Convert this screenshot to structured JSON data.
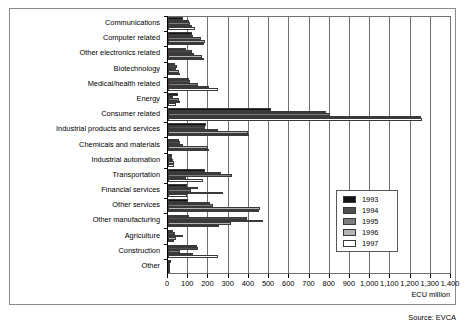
{
  "source_note": "Source: EVCA",
  "axis_unit": "ECU million",
  "legend": {
    "position": "inside-right",
    "entries": [
      {
        "label": "1993",
        "color": "#131313"
      },
      {
        "label": "1994",
        "color": "#4f4f4f"
      },
      {
        "label": "1995",
        "color": "#7d7d7d"
      },
      {
        "label": "1996",
        "color": "#b4b4b4"
      },
      {
        "label": "1997",
        "color": "#ffffff"
      }
    ]
  },
  "chart_data": {
    "type": "bar",
    "orientation": "horizontal",
    "title": "",
    "subtitle": "",
    "xlabel": "ECU million",
    "ylabel": "",
    "xlim": [
      0,
      1400
    ],
    "xticks": [
      0,
      100,
      200,
      300,
      400,
      500,
      600,
      700,
      800,
      900,
      1000,
      1100,
      1200,
      1300,
      1400
    ],
    "xtick_labels": [
      "0",
      "100",
      "200",
      "300",
      "400",
      "500",
      "600",
      "700",
      "800",
      "900",
      "1,000",
      "1,100",
      "1,200",
      "1,300",
      "1,400"
    ],
    "grid": true,
    "grid_axis": "x",
    "categories": [
      "Communications",
      "Computer related",
      "Other electronics related",
      "Biotechnology",
      "Medical/health related",
      "Energy",
      "Consumer related",
      "Industrial products and services",
      "Chemicals and materials",
      "Industrial automation",
      "Transportation",
      "Financial services",
      "Other services",
      "Other manufacturing",
      "Agriculture",
      "Construction",
      "Other"
    ],
    "series": [
      {
        "name": "1993",
        "color": "#131313",
        "values": [
          75,
          120,
          90,
          35,
          105,
          50,
          510,
          190,
          55,
          20,
          185,
          95,
          100,
          105,
          25,
          145,
          15
        ]
      },
      {
        "name": "1994",
        "color": "#4f4f4f",
        "values": [
          105,
          125,
          120,
          45,
          110,
          25,
          780,
          185,
          60,
          18,
          260,
          150,
          210,
          390,
          35,
          150,
          12
        ]
      },
      {
        "name": "1995",
        "color": "#7d7d7d",
        "values": [
          110,
          165,
          130,
          40,
          150,
          55,
          800,
          245,
          75,
          25,
          315,
          115,
          225,
          470,
          75,
          60,
          10
        ]
      },
      {
        "name": "1996",
        "color": "#b4b4b4",
        "values": [
          120,
          185,
          170,
          55,
          205,
          60,
          1250,
          395,
          200,
          30,
          90,
          270,
          455,
          310,
          40,
          125,
          10
        ]
      },
      {
        "name": "1997",
        "color": "#ffffff",
        "values": [
          135,
          180,
          180,
          60,
          245,
          40,
          1255,
          400,
          205,
          30,
          175,
          95,
          450,
          250,
          30,
          245,
          8
        ]
      }
    ]
  }
}
